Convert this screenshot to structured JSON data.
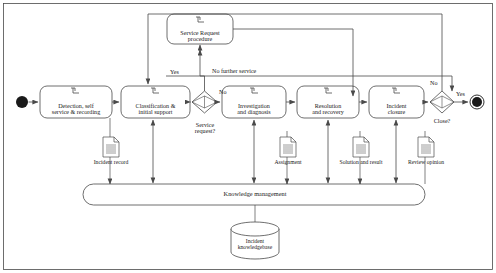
{
  "diagram": {
    "type": "uml-activity-diagram",
    "colors": {
      "stroke": "#4a4a4a",
      "fill": "#ffffff",
      "text": "#1a1a1a",
      "terminator": "#1a1a1a"
    },
    "start_node": {
      "name": "start",
      "label": ""
    },
    "end_node": {
      "name": "end",
      "label": ""
    },
    "activities": [
      {
        "id": "detection",
        "label": "Detection, self\nservice & recording",
        "line1": "Detection, self",
        "line2": "service & recording"
      },
      {
        "id": "classification",
        "label": "Classification &\ninitial support",
        "line1": "Classification &",
        "line2": "initial support"
      },
      {
        "id": "service_request",
        "label": "Service Request\nprocedure",
        "line1": "Service Request",
        "line2": "procedure"
      },
      {
        "id": "investigation",
        "label": "Investigation\nand diagnosis",
        "line1": "Investigation",
        "line2": "and diagnosis"
      },
      {
        "id": "resolution",
        "label": "Resolution\nand recovery",
        "line1": "Resolution",
        "line2": "and recovery"
      },
      {
        "id": "closure",
        "label": "Incident\nclosure",
        "line1": "Incident",
        "line2": "closure"
      }
    ],
    "decisions": [
      {
        "id": "service_request_decision",
        "label": "Service\nrequest?",
        "line1": "Service",
        "line2": "request?"
      },
      {
        "id": "close_decision",
        "label": "Close?",
        "line1": "Close?",
        "line2": ""
      }
    ],
    "edge_labels": [
      {
        "id": "yes-service-request",
        "text": "Yes"
      },
      {
        "id": "no-service-request",
        "text": "No"
      },
      {
        "id": "no-further-service",
        "text": "No further service"
      },
      {
        "id": "no-close",
        "text": "No"
      },
      {
        "id": "yes-close",
        "text": "Yes"
      }
    ],
    "artifacts": [
      {
        "id": "incident-record",
        "label": "Incident record"
      },
      {
        "id": "assignment",
        "label": "Assignment"
      },
      {
        "id": "solution-and-result",
        "label": "Solution and result"
      },
      {
        "id": "review-opinion",
        "label": "Review opinion"
      }
    ],
    "knowledge_bar": {
      "id": "knowledge-management",
      "label": "Knowledge management"
    },
    "datastore": {
      "id": "incident-knowledgebase",
      "line1": "Incident",
      "line2": "knowledgebase"
    }
  }
}
